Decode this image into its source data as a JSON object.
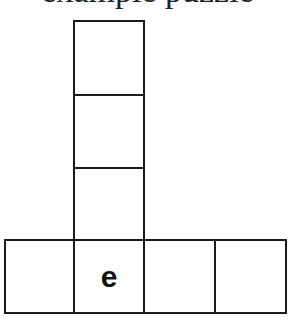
{
  "title": "example puzzle",
  "grid": {
    "column_cells": [
      {
        "letter": ""
      },
      {
        "letter": ""
      },
      {
        "letter": ""
      }
    ],
    "row_cells": [
      {
        "letter": ""
      },
      {
        "letter": "e"
      },
      {
        "letter": ""
      },
      {
        "letter": ""
      }
    ]
  }
}
